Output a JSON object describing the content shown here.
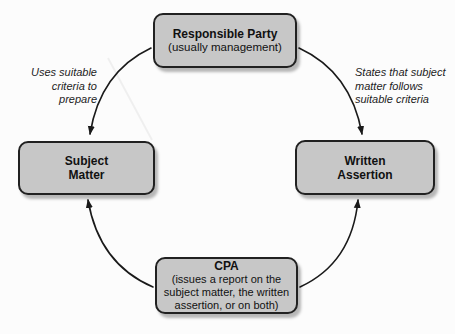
{
  "diagram": {
    "nodes": {
      "responsible_party": {
        "title": "Responsible Party",
        "subtitle": "(usually management)"
      },
      "subject_matter": {
        "title": [
          "Subject",
          "Matter"
        ]
      },
      "written_assertion": {
        "title": [
          "Written",
          "Assertion"
        ]
      },
      "cpa": {
        "title": "CPA",
        "subtitle": [
          "(issues a report on the",
          "subject matter, the written",
          "assertion, or on both)"
        ]
      }
    },
    "annotations": {
      "uses_criteria": [
        "Uses suitable",
        "criteria to",
        "prepare"
      ],
      "states_assertion": [
        "States that subject",
        "matter follows",
        "suitable criteria"
      ]
    },
    "colors": {
      "box_fill": "#c7c7c7",
      "box_border": "#212121",
      "arrow": "#1a1a1a",
      "text": "#111111",
      "background": "#fcfcfc"
    }
  }
}
